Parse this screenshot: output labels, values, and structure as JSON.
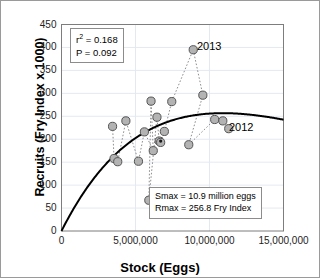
{
  "chart_data": {
    "type": "scatter",
    "title": "",
    "xlabel": "Stock (Eggs)",
    "ylabel": "Recruits (Fry Index x 1000)",
    "xlim": [
      0,
      15000000
    ],
    "ylim": [
      0,
      450
    ],
    "xticks": [
      "0",
      "5,000,000",
      "10,000,000",
      "15,000,000"
    ],
    "xtick_values": [
      0,
      5000000,
      10000000,
      15000000
    ],
    "yticks": [
      "0",
      "50",
      "100",
      "150",
      "200",
      "250",
      "300",
      "350",
      "400",
      "450"
    ],
    "ytick_values": [
      0,
      50,
      100,
      150,
      200,
      250,
      300,
      350,
      400,
      450
    ],
    "grid": true,
    "legend": "none",
    "series": [
      {
        "name": "Stock-recruitment observations",
        "marker": "circle",
        "marker_fill": "#b3b3b3",
        "marker_edge": "#555555",
        "connector": "dotted",
        "points": [
          {
            "x": 3450000,
            "y": 228
          },
          {
            "x": 3550000,
            "y": 158
          },
          {
            "x": 3800000,
            "y": 151
          },
          {
            "x": 4350000,
            "y": 240
          },
          {
            "x": 5200000,
            "y": 152
          },
          {
            "x": 5600000,
            "y": 216
          },
          {
            "x": 5900000,
            "y": 67
          },
          {
            "x": 6050000,
            "y": 283
          },
          {
            "x": 6200000,
            "y": 175
          },
          {
            "x": 6450000,
            "y": 248
          },
          {
            "x": 6600000,
            "y": 196
          },
          {
            "x": 6700000,
            "y": 193
          },
          {
            "x": 6950000,
            "y": 217
          },
          {
            "x": 7450000,
            "y": 282
          },
          {
            "x": 8600000,
            "y": 188
          },
          {
            "x": 8900000,
            "y": 395
          },
          {
            "x": 9550000,
            "y": 296
          },
          {
            "x": 10350000,
            "y": 243
          },
          {
            "x": 10900000,
            "y": 240
          },
          {
            "x": 11300000,
            "y": 223
          }
        ]
      },
      {
        "name": "Fitted stock-recruitment curve",
        "marker": "none",
        "line": "solid",
        "line_color": "#000000"
      }
    ],
    "annotations": [
      {
        "name": "point-label-2013",
        "text": "2013",
        "x": 8900000,
        "y": 395
      },
      {
        "name": "point-label-2012",
        "text": "2012",
        "x": 11300000,
        "y": 223
      }
    ]
  },
  "stats_box": {
    "r_squared_prefix": "r",
    "r_squared_exponent": "2",
    "r_squared_value": " = 0.168",
    "p_value": "P = 0.092"
  },
  "params_box": {
    "smax": "Smax = 10.9 million eggs",
    "rmax": "Rmax = 256.8 Fry Index"
  },
  "axes": {
    "x_title": "Stock (Eggs)",
    "y_title": "Recruits (Fry Index x 1000)"
  }
}
